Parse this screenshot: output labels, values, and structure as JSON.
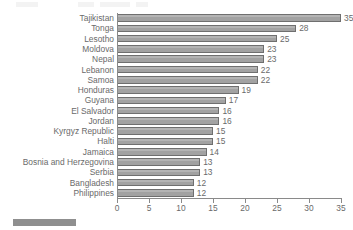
{
  "chart_data": {
    "type": "bar",
    "orientation": "horizontal",
    "title": "",
    "subtitle": "",
    "xlabel": "",
    "ylabel": "",
    "xlim": [
      0,
      35
    ],
    "xticks": [
      0,
      5,
      10,
      15,
      20,
      25,
      30,
      35
    ],
    "grid": false,
    "legend": null,
    "show_value_labels": true,
    "categories": [
      "Tajikistan",
      "Tonga",
      "Lesotho",
      "Moldova",
      "Nepal",
      "Lebanon",
      "Samoa",
      "Honduras",
      "Guyana",
      "El Salvador",
      "Jordan",
      "Kyrgyz Republic",
      "Halti",
      "Jamaica",
      "Bosnia and Herzegovina",
      "Serbia",
      "Bangladesh",
      "Philippines"
    ],
    "values": [
      35,
      28,
      25,
      23,
      23,
      22,
      22,
      19,
      17,
      16,
      16,
      15,
      15,
      14,
      13,
      13,
      12,
      12
    ],
    "value_labels": [
      "35",
      "28",
      "25",
      "23",
      "23",
      "22",
      "22",
      "19",
      "17",
      "16",
      "16",
      "15",
      "15",
      "14",
      "13",
      "13",
      "12",
      "12"
    ],
    "colors": {
      "bar_fill": "#a8a8a8",
      "bar_border": "#6f6f6f",
      "text": "#6a6a6a",
      "axis": "#8a8a8a",
      "background": "#ffffff",
      "swatch": "#8f8f8f"
    }
  },
  "xaxis": {
    "tick_labels": [
      "0",
      "5",
      "10",
      "15",
      "20",
      "25",
      "30",
      "35"
    ]
  }
}
